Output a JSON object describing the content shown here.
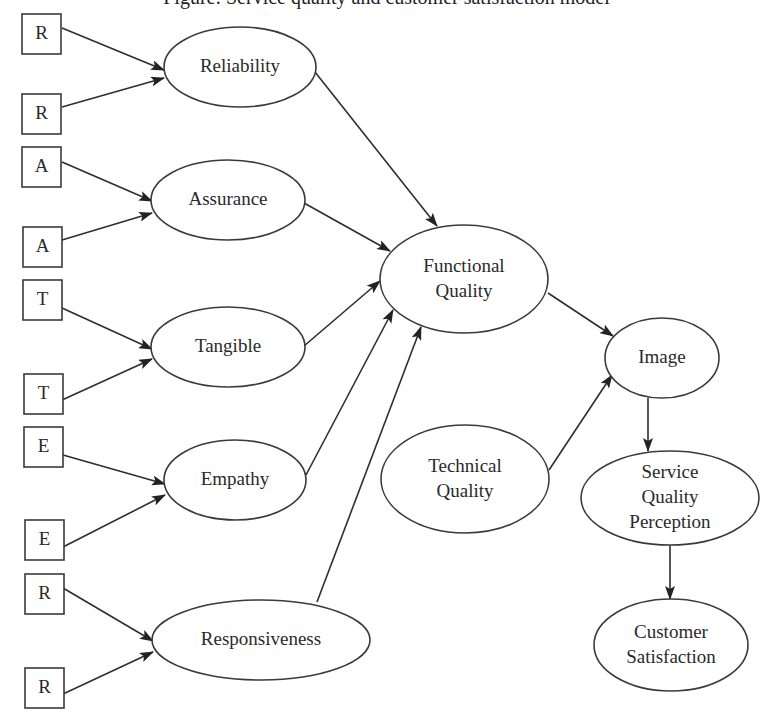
{
  "title_partial": "Figure: Service quality and customer satisfaction model",
  "indicators": [
    {
      "id": "r1",
      "label": "R",
      "x": 22,
      "y": 14
    },
    {
      "id": "r2",
      "label": "R",
      "x": 22,
      "y": 94
    },
    {
      "id": "a1",
      "label": "A",
      "x": 22,
      "y": 147
    },
    {
      "id": "a2",
      "label": "A",
      "x": 23,
      "y": 227
    },
    {
      "id": "t1",
      "label": "T",
      "x": 23,
      "y": 280
    },
    {
      "id": "t2",
      "label": "T",
      "x": 24,
      "y": 374
    },
    {
      "id": "e1",
      "label": "E",
      "x": 24,
      "y": 427
    },
    {
      "id": "e2",
      "label": "E",
      "x": 25,
      "y": 520
    },
    {
      "id": "r3",
      "label": "R",
      "x": 25,
      "y": 574
    },
    {
      "id": "r4",
      "label": "R",
      "x": 25,
      "y": 668
    }
  ],
  "constructs": {
    "reliability": {
      "lines": [
        "Reliability"
      ],
      "cx": 240,
      "cy": 67,
      "rx": 76,
      "ry": 40
    },
    "assurance": {
      "lines": [
        "Assurance"
      ],
      "cx": 228,
      "cy": 200,
      "rx": 77,
      "ry": 40
    },
    "tangible": {
      "lines": [
        "Tangible"
      ],
      "cx": 228,
      "cy": 347,
      "rx": 77,
      "ry": 40
    },
    "empathy": {
      "lines": [
        "Empathy"
      ],
      "cx": 235,
      "cy": 480,
      "rx": 71,
      "ry": 40
    },
    "responsiveness": {
      "lines": [
        "Responsiveness"
      ],
      "cx": 261,
      "cy": 640,
      "rx": 109,
      "ry": 40
    },
    "functional_quality": {
      "lines": [
        "Functional",
        "Quality"
      ],
      "cx": 464,
      "cy": 279,
      "rx": 84,
      "ry": 54
    },
    "technical_quality": {
      "lines": [
        "Technical",
        "Quality"
      ],
      "cx": 465,
      "cy": 479,
      "rx": 84,
      "ry": 54
    },
    "image": {
      "lines": [
        "Image"
      ],
      "cx": 662,
      "cy": 358,
      "rx": 57,
      "ry": 40
    },
    "service_quality_perception": {
      "lines": [
        "Service",
        "Quality",
        "Perception"
      ],
      "cx": 670,
      "cy": 498,
      "rx": 89,
      "ry": 47
    },
    "customer_satisfaction": {
      "lines": [
        "Customer",
        "Satisfaction"
      ],
      "cx": 671,
      "cy": 645,
      "rx": 77,
      "ry": 46
    }
  },
  "edges": [
    {
      "from": "r1",
      "to": "reliability",
      "x1": 62,
      "y1": 28,
      "x2": 164,
      "y2": 70
    },
    {
      "from": "r2",
      "to": "reliability",
      "x1": 62,
      "y1": 107,
      "x2": 164,
      "y2": 78
    },
    {
      "from": "a1",
      "to": "assurance",
      "x1": 62,
      "y1": 162,
      "x2": 152,
      "y2": 201
    },
    {
      "from": "a2",
      "to": "assurance",
      "x1": 62,
      "y1": 240,
      "x2": 152,
      "y2": 213
    },
    {
      "from": "t1",
      "to": "tangible",
      "x1": 62,
      "y1": 308,
      "x2": 152,
      "y2": 349
    },
    {
      "from": "t2",
      "to": "tangible",
      "x1": 62,
      "y1": 400,
      "x2": 152,
      "y2": 359
    },
    {
      "from": "e1",
      "to": "empathy",
      "x1": 63,
      "y1": 455,
      "x2": 165,
      "y2": 484
    },
    {
      "from": "e2",
      "to": "empathy",
      "x1": 63,
      "y1": 547,
      "x2": 165,
      "y2": 495
    },
    {
      "from": "r3",
      "to": "responsiveness",
      "x1": 63,
      "y1": 588,
      "x2": 153,
      "y2": 641
    },
    {
      "from": "r4",
      "to": "responsiveness",
      "x1": 63,
      "y1": 694,
      "x2": 153,
      "y2": 652
    },
    {
      "from": "reliability",
      "to": "functional_quality",
      "x1": 315,
      "y1": 72,
      "x2": 437,
      "y2": 226
    },
    {
      "from": "assurance",
      "to": "functional_quality",
      "x1": 304,
      "y1": 203,
      "x2": 390,
      "y2": 251
    },
    {
      "from": "tangible",
      "to": "functional_quality",
      "x1": 304,
      "y1": 346,
      "x2": 380,
      "y2": 281
    },
    {
      "from": "empathy",
      "to": "functional_quality",
      "x1": 306,
      "y1": 475,
      "x2": 393,
      "y2": 310
    },
    {
      "from": "responsiveness",
      "to": "functional_quality",
      "x1": 317,
      "y1": 602,
      "x2": 421,
      "y2": 327
    },
    {
      "from": "functional_quality",
      "to": "image",
      "x1": 548,
      "y1": 293,
      "x2": 613,
      "y2": 336
    },
    {
      "from": "technical_quality",
      "to": "image",
      "x1": 549,
      "y1": 470,
      "x2": 612,
      "y2": 375
    },
    {
      "from": "image",
      "to": "service_quality_perception",
      "x1": 648,
      "y1": 398,
      "x2": 648,
      "y2": 451
    },
    {
      "from": "service_quality_perception",
      "to": "customer_satisfaction",
      "x1": 670,
      "y1": 545,
      "x2": 670,
      "y2": 599
    }
  ],
  "style": {
    "line_color": "#2e2e2e",
    "background": "#ffffff",
    "text_color": "#2a2a2a"
  }
}
